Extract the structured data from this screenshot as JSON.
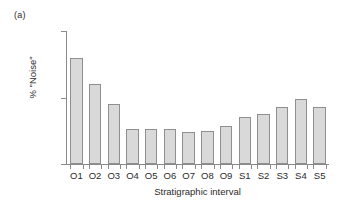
{
  "figure": {
    "panel_label": "(a)",
    "background_color": "#ffffff"
  },
  "chart_data": {
    "type": "bar",
    "title": "",
    "subtitle": "",
    "categories": [
      "O1",
      "O2",
      "O3",
      "O4",
      "O5",
      "O6",
      "O7",
      "O8",
      "O9",
      "S1",
      "S2",
      "S3",
      "S4",
      "S5"
    ],
    "values": [
      32,
      24,
      18,
      10.5,
      10.5,
      10.5,
      9.5,
      10,
      11.5,
      14,
      15,
      17,
      19.5,
      17
    ],
    "xlabel": "Stratigraphic interval",
    "ylabel": "% \"Noise\"",
    "ylim": [
      0,
      40
    ],
    "yticks": [
      0,
      20,
      40
    ],
    "ytick_labels": [
      "0",
      "20",
      "40"
    ],
    "grid": false,
    "legend": false,
    "bar_fill_color": "#d9d9d9",
    "bar_edge_color": "#8f8f8f",
    "axis_color": "#8a8a8a"
  }
}
